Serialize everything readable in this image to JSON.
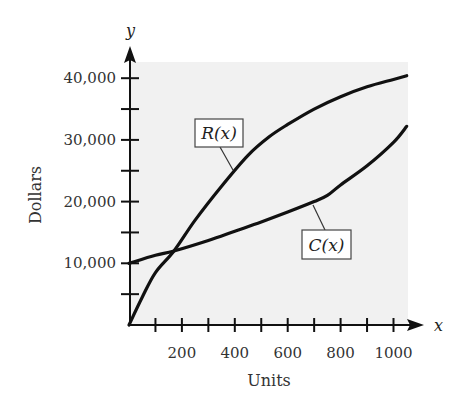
{
  "chart_data": {
    "type": "line",
    "title": "",
    "xlabel": "Units",
    "ylabel": "Dollars",
    "x_axis_var": "x",
    "y_axis_var": "y",
    "xlim": [
      0,
      1100
    ],
    "ylim": [
      0,
      42000
    ],
    "x_ticks": [
      100,
      200,
      300,
      400,
      500,
      600,
      700,
      800,
      900,
      1000
    ],
    "x_tick_labels": [
      "200",
      "400",
      "600",
      "800",
      "1000"
    ],
    "x_tick_label_values": [
      200,
      400,
      600,
      800,
      1000
    ],
    "y_ticks": [
      5000,
      10000,
      15000,
      20000,
      25000,
      30000,
      35000,
      40000
    ],
    "y_tick_labels": [
      "10,000",
      "20,000",
      "30,000",
      "40,000"
    ],
    "y_tick_label_values": [
      10000,
      20000,
      30000,
      40000
    ],
    "grid": false,
    "legend": "inline labels",
    "shaded_background": "#f1f1f1",
    "series": [
      {
        "name": "R(x)",
        "label": "R(x)",
        "x": [
          0,
          50,
          100,
          170,
          250,
          350,
          450,
          530,
          600,
          700,
          800,
          900,
          1000,
          1050
        ],
        "values": [
          0,
          4500,
          8500,
          12000,
          17000,
          22500,
          27500,
          30500,
          32500,
          35000,
          37000,
          38600,
          39800,
          40400
        ]
      },
      {
        "name": "C(x)",
        "label": "C(x)",
        "x": [
          0,
          100,
          170,
          300,
          400,
          500,
          600,
          700,
          750,
          800,
          900,
          1000,
          1050
        ],
        "values": [
          10000,
          11300,
          12000,
          13700,
          15200,
          16700,
          18300,
          20000,
          21000,
          22700,
          25800,
          29600,
          32200
        ]
      }
    ],
    "annotations": [
      {
        "text": "R(x)",
        "points_to_x": 400,
        "points_to_y": 25000
      },
      {
        "text": "C(x)",
        "points_to_x": 700,
        "points_to_y": 20000
      }
    ],
    "break_even_point": {
      "x": 170,
      "y": 12000
    }
  }
}
